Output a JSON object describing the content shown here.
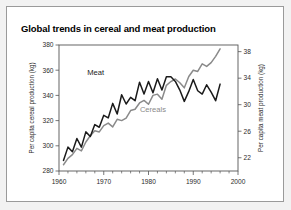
{
  "figure": {
    "background": "#f2f2f2",
    "card_background": "#ffffff",
    "border_color": "#9a9a9a"
  },
  "chart_data": {
    "type": "line",
    "title": "Global trends in cereal and meat production",
    "xlabel": "",
    "ylabel": "Per capita cereal production (kg)",
    "y2label": "Per capita meat production (kg)",
    "xlim": [
      1960,
      2000
    ],
    "ylim": [
      280,
      380
    ],
    "y2lim": [
      20,
      39
    ],
    "xticks": [
      1960,
      1970,
      1980,
      1990,
      2000
    ],
    "xticklabels": [
      "1960",
      "1970",
      "1980",
      "1990",
      "2000"
    ],
    "yticks": [
      280,
      300,
      320,
      340,
      360,
      380
    ],
    "yticklabels": [
      "280",
      "300",
      "320",
      "340",
      "360",
      "380"
    ],
    "y2ticks": [
      22,
      26,
      30,
      34,
      38
    ],
    "y2ticklabels": [
      "22",
      "26",
      "30",
      "34",
      "38"
    ],
    "xminor_step": 2,
    "grid": false,
    "legend": "inline-annotations",
    "annotations": [
      {
        "text": "Meat",
        "x": 1968.2,
        "y": 356.5,
        "color": "#1a1a1a"
      },
      {
        "text": "Cereals",
        "x": 1981.0,
        "y": 327.0,
        "color": "#8a8a8a"
      }
    ],
    "x": [
      1961,
      1962,
      1963,
      1964,
      1965,
      1966,
      1967,
      1968,
      1969,
      1970,
      1971,
      1972,
      1973,
      1974,
      1975,
      1976,
      1977,
      1978,
      1979,
      1980,
      1981,
      1982,
      1983,
      1984,
      1985,
      1986,
      1987,
      1988,
      1989,
      1990,
      1991,
      1992,
      1993,
      1994,
      1995,
      1996
    ],
    "series": [
      {
        "name": "Cereals",
        "axis": "left",
        "color": "#8a8a8a",
        "unit": "kg",
        "values": [
          285,
          290,
          293,
          298,
          296,
          303,
          308,
          312,
          311,
          316,
          318,
          315,
          321,
          320,
          322,
          328,
          329,
          334,
          336,
          333,
          340,
          341,
          337,
          348,
          351,
          353,
          350,
          346,
          355,
          360,
          359,
          365,
          363,
          366,
          371,
          377
        ]
      },
      {
        "name": "Meat",
        "axis": "right",
        "color": "#1a1a1a",
        "unit": "kg",
        "values": [
          21.6,
          23.6,
          22.9,
          24.9,
          23.6,
          25.9,
          25.2,
          27.0,
          26.6,
          28.4,
          28.0,
          30.2,
          28.6,
          31.5,
          30.1,
          31.1,
          30.6,
          33.4,
          31.6,
          33.5,
          31.8,
          33.9,
          32.2,
          34.2,
          34.2,
          33.5,
          32.2,
          30.5,
          32.0,
          33.8,
          32.1,
          31.6,
          33.0,
          31.9,
          30.6,
          33.1
        ]
      }
    ]
  }
}
